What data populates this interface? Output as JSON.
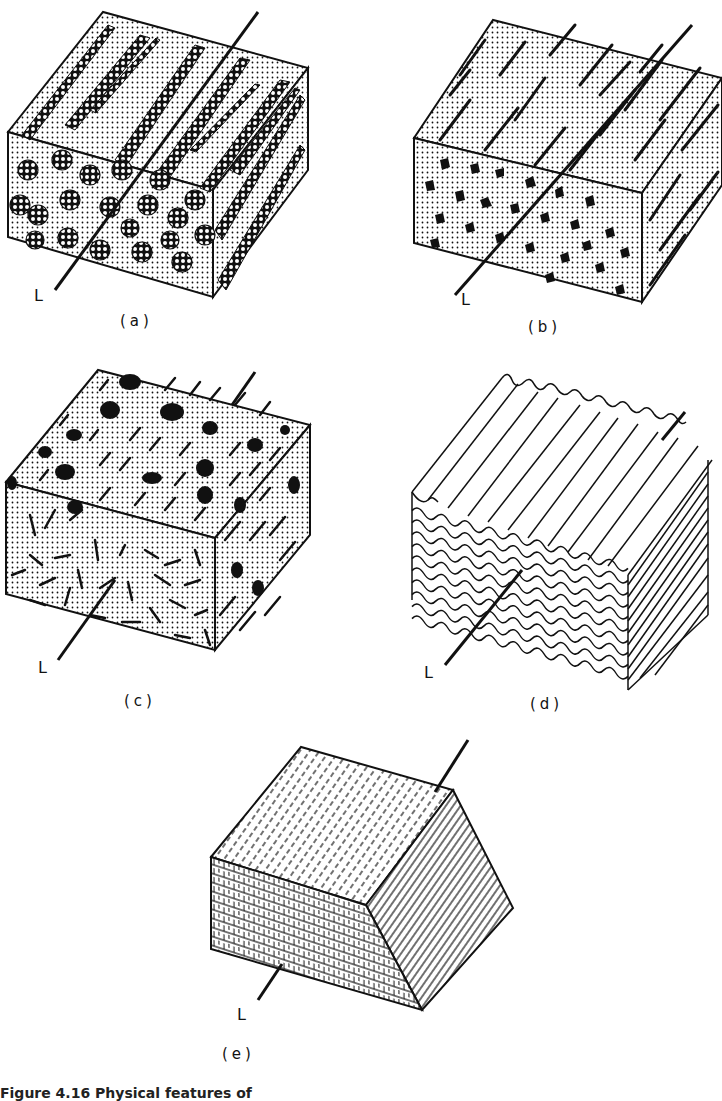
{
  "figure": {
    "caption": "Figure 4.16 Physical features of",
    "axis_label": "L",
    "panels": [
      {
        "id": "a",
        "label": "(a)",
        "description": "unidirectional fibre bundles (cellular bundles) in matrix"
      },
      {
        "id": "b",
        "label": "(b)",
        "description": "aligned short fibres in dotted matrix"
      },
      {
        "id": "c",
        "label": "(c)",
        "description": "random short fibres and particles in matrix"
      },
      {
        "id": "d",
        "label": "(d)",
        "description": "corrugated laminate layers"
      },
      {
        "id": "e",
        "label": "(e)",
        "description": "laminated block with cross-hatched layers"
      }
    ]
  },
  "colors": {
    "ink": "#111111",
    "paper": "#ffffff"
  }
}
